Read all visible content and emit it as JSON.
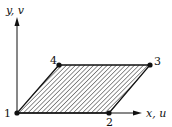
{
  "diagram": {
    "axes": {
      "y_label": "y, v",
      "x_label": "x, u"
    },
    "nodes": [
      {
        "id": "1",
        "label": "1"
      },
      {
        "id": "2",
        "label": "2"
      },
      {
        "id": "3",
        "label": "3"
      },
      {
        "id": "4",
        "label": "4"
      }
    ],
    "shape": "hatched parallelogram with corners 1-2-3-4",
    "colors": {
      "ink": "#111111",
      "background": "#ffffff"
    }
  }
}
